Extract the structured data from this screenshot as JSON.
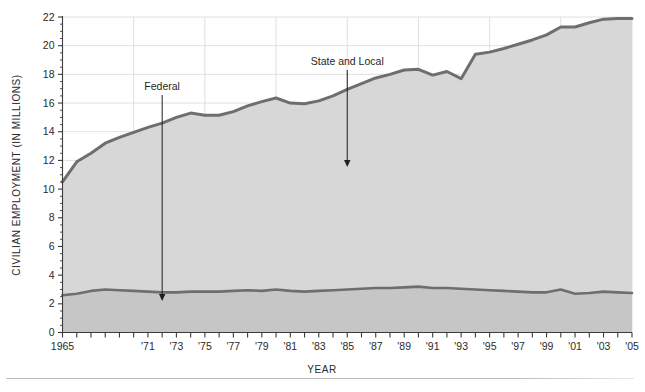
{
  "figure": {
    "background_color": "#ffffff",
    "has_footer_rule": true
  },
  "axes": {
    "y_title": "CIVILIAN EMPLOYMENT (IN MILLIONS)",
    "x_title": "YEAR",
    "y_ticks": [
      "0",
      "2",
      "4",
      "6",
      "8",
      "10",
      "12",
      "14",
      "16",
      "18",
      "20",
      "22"
    ],
    "x_ticks": [
      "1965",
      "'71",
      "'73",
      "'75",
      "'77",
      "'79",
      "'81",
      "'83",
      "'85",
      "'87",
      "'89",
      "'91",
      "'93",
      "'95",
      "'97",
      "'99",
      "'01",
      "'03",
      "'05"
    ]
  },
  "annotations": [
    {
      "label": "Federal",
      "target": "federal-series"
    },
    {
      "label": "State and Local",
      "target": "state-and-local-series"
    }
  ],
  "chart_data": {
    "type": "area",
    "title": "",
    "subtitle": "",
    "xlabel": "YEAR",
    "ylabel": "CIVILIAN EMPLOYMENT (IN MILLIONS)",
    "xlim": [
      1965,
      2005
    ],
    "ylim": [
      0,
      22
    ],
    "y_tick_step": 2,
    "y_minor_tick_step": 0.5,
    "x_tick_step": 1,
    "x_tick_labels": [
      "1965",
      "'71",
      "'73",
      "'75",
      "'77",
      "'79",
      "'81",
      "'83",
      "'85",
      "'87",
      "'89",
      "'91",
      "'93",
      "'95",
      "'97",
      "'99",
      "'01",
      "'03",
      "'05"
    ],
    "x_tick_label_years": [
      1965,
      1971,
      1973,
      1975,
      1977,
      1979,
      1981,
      1983,
      1985,
      1987,
      1989,
      1991,
      1993,
      1995,
      1997,
      1999,
      2001,
      2003,
      2005
    ],
    "grid": {
      "vertical": true,
      "horizontal": true,
      "interval_years": 5,
      "color": "#dcdcdc"
    },
    "legend": {
      "visible": false,
      "position": "none",
      "style": "inline-annotations"
    },
    "stacking": "stacked",
    "colors": {
      "federal_fill": "#c6c6c6",
      "state_local_fill": "#d7d7d7",
      "line": "#6e6e6e",
      "axis": "#3b3b3b",
      "grid": "#dcdcdc",
      "text": "#1f1f1f"
    },
    "x": [
      1965,
      1966,
      1967,
      1968,
      1969,
      1970,
      1971,
      1972,
      1973,
      1974,
      1975,
      1976,
      1977,
      1978,
      1979,
      1980,
      1981,
      1982,
      1983,
      1984,
      1985,
      1986,
      1987,
      1988,
      1989,
      1990,
      1991,
      1992,
      1993,
      1994,
      1995,
      1996,
      1997,
      1998,
      1999,
      2000,
      2001,
      2002,
      2003,
      2004,
      2005
    ],
    "series": [
      {
        "name": "Federal",
        "values": [
          2.6,
          2.7,
          2.9,
          3.0,
          2.95,
          2.9,
          2.85,
          2.8,
          2.8,
          2.85,
          2.85,
          2.85,
          2.9,
          2.95,
          2.9,
          3.0,
          2.9,
          2.85,
          2.9,
          2.95,
          3.0,
          3.05,
          3.1,
          3.1,
          3.15,
          3.2,
          3.1,
          3.1,
          3.05,
          3.0,
          2.95,
          2.9,
          2.85,
          2.8,
          2.8,
          3.0,
          2.7,
          2.75,
          2.85,
          2.8,
          2.75
        ]
      },
      {
        "name": "State and Local",
        "values": [
          7.9,
          9.2,
          9.6,
          10.2,
          10.65,
          11.05,
          11.45,
          11.8,
          12.2,
          12.45,
          12.3,
          12.3,
          12.5,
          12.85,
          13.2,
          13.35,
          13.1,
          13.1,
          13.25,
          13.55,
          13.95,
          14.3,
          14.65,
          14.9,
          15.15,
          15.15,
          14.85,
          15.1,
          14.65,
          16.4,
          16.6,
          16.9,
          17.25,
          17.6,
          17.95,
          18.3,
          18.6,
          18.85,
          19.0,
          19.1,
          19.15
        ]
      }
    ],
    "totals": [
      10.5,
      11.9,
      12.5,
      13.2,
      13.6,
      13.95,
      14.3,
      14.6,
      15.0,
      15.3,
      15.15,
      15.15,
      15.4,
      15.8,
      16.1,
      16.35,
      16.0,
      15.95,
      16.15,
      16.5,
      16.95,
      17.35,
      17.75,
      18.0,
      18.3,
      18.35,
      17.95,
      18.2,
      17.7,
      19.4,
      19.55,
      19.8,
      20.1,
      20.4,
      20.75,
      21.3,
      21.3,
      21.6,
      21.85,
      21.9,
      21.9
    ]
  }
}
